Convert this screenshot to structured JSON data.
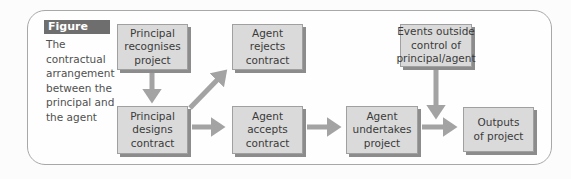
{
  "figure": {
    "label": "Figure 2.2",
    "caption_lines": [
      "The",
      "contractual",
      "arrangement",
      "between the",
      "principal and",
      "the agent"
    ]
  },
  "nodes": {
    "principal_recognises": {
      "lines": [
        "Principal",
        "recognises",
        "project"
      ]
    },
    "agent_rejects": {
      "lines": [
        "Agent",
        "rejects",
        "contract"
      ]
    },
    "principal_designs": {
      "lines": [
        "Principal",
        "designs",
        "contract"
      ]
    },
    "agent_accepts": {
      "lines": [
        "Agent",
        "accepts",
        "contract"
      ]
    },
    "agent_undertakes": {
      "lines": [
        "Agent",
        "undertakes",
        "project"
      ]
    },
    "events_outside": {
      "lines": [
        "Events outside",
        "control of",
        "principal/agent"
      ]
    },
    "outputs": {
      "lines": [
        "Outputs",
        "of project"
      ]
    }
  },
  "edges": [
    {
      "from": "principal_recognises",
      "to": "principal_designs"
    },
    {
      "from": "principal_designs",
      "to": "agent_rejects"
    },
    {
      "from": "principal_designs",
      "to": "agent_accepts"
    },
    {
      "from": "agent_accepts",
      "to": "agent_undertakes"
    },
    {
      "from": "agent_undertakes",
      "to": "outputs"
    },
    {
      "from": "events_outside",
      "to": "outputs"
    }
  ],
  "colors": {
    "box_fill": "#dadada",
    "box_shadow": "#8c8c8c",
    "arrow": "#a3a3a3",
    "badge": "#6e6e6e",
    "frame": "#a8a8a8"
  }
}
